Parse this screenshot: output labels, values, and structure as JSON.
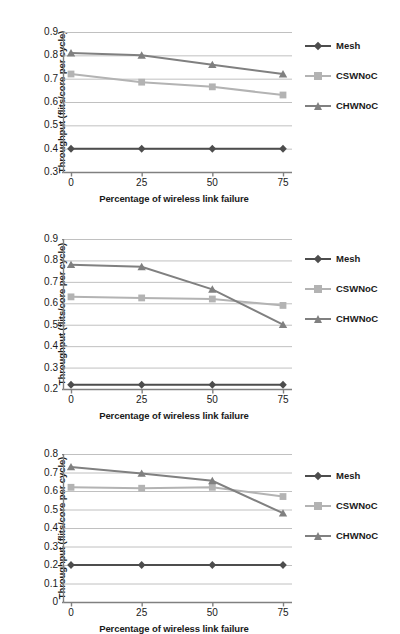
{
  "colors": {
    "mesh": "#4d4d4d",
    "cswnoc": "#b3b3b3",
    "chwnoc": "#808080",
    "axis": "#808080",
    "grid": "#c0c0c0",
    "text": "#1a1a1a"
  },
  "legend": {
    "position": "right",
    "items": [
      {
        "label": "Mesh",
        "marker": "diamond-marker",
        "color_key": "mesh"
      },
      {
        "label": "CSWNoC",
        "marker": "square-marker",
        "color_key": "cswnoc"
      },
      {
        "label": "CHWNoC",
        "marker": "triangle-marker",
        "color_key": "chwnoc"
      }
    ]
  },
  "axis_titles": {
    "y": "Throughput (flits/core per cycle)",
    "x": "Percentage of wireless link failure"
  },
  "chart_data": [
    {
      "type": "line",
      "title": "",
      "xlabel": "Percentage of wireless link failure",
      "ylabel": "Throughput (flits/core per cycle)",
      "categories": [
        0,
        25,
        50,
        75
      ],
      "xticklabels": [
        "0",
        "25",
        "50",
        "75"
      ],
      "yticklabels": [
        "0.3",
        "0.4",
        "0.5",
        "0.6",
        "0.7",
        "0.8",
        "0.9"
      ],
      "xlim": [
        0,
        75
      ],
      "ylim": [
        0.3,
        0.9
      ],
      "ystep": 0.1,
      "grid": true,
      "series": [
        {
          "name": "Mesh",
          "marker": "diamond-marker",
          "values": [
            0.4,
            0.4,
            0.4,
            0.4
          ]
        },
        {
          "name": "CSWNoC",
          "marker": "square-marker",
          "values": [
            0.72,
            0.685,
            0.665,
            0.63
          ]
        },
        {
          "name": "CHWNoC",
          "marker": "triangle-marker",
          "values": [
            0.81,
            0.8,
            0.76,
            0.72
          ]
        }
      ]
    },
    {
      "type": "line",
      "title": "",
      "xlabel": "Percentage of wireless link failure",
      "ylabel": "Throughput (flits/core per cycle)",
      "categories": [
        0,
        25,
        50,
        75
      ],
      "xticklabels": [
        "0",
        "25",
        "50",
        "75"
      ],
      "yticklabels": [
        "0.2",
        "0.3",
        "0.4",
        "0.5",
        "0.6",
        "0.7",
        "0.8",
        "0.9"
      ],
      "xlim": [
        0,
        75
      ],
      "ylim": [
        0.2,
        0.9
      ],
      "ystep": 0.1,
      "grid": true,
      "series": [
        {
          "name": "Mesh",
          "marker": "diamond-marker",
          "values": [
            0.22,
            0.22,
            0.22,
            0.22
          ]
        },
        {
          "name": "CSWNoC",
          "marker": "square-marker",
          "values": [
            0.63,
            0.625,
            0.62,
            0.59
          ]
        },
        {
          "name": "CHWNoC",
          "marker": "triangle-marker",
          "values": [
            0.78,
            0.77,
            0.665,
            0.5
          ]
        }
      ]
    },
    {
      "type": "line",
      "title": "",
      "xlabel": "Percentage of wireless link failure",
      "ylabel": "Throughput (flits/core per cycle)",
      "categories": [
        0,
        25,
        50,
        75
      ],
      "xticklabels": [
        "0",
        "25",
        "50",
        "75"
      ],
      "yticklabels": [
        "0",
        "0.1",
        "0.2",
        "0.3",
        "0.4",
        "0.5",
        "0.6",
        "0.7",
        "0.8"
      ],
      "xlim": [
        0,
        75
      ],
      "ylim": [
        0,
        0.8
      ],
      "ystep": 0.1,
      "grid": true,
      "series": [
        {
          "name": "Mesh",
          "marker": "diamond-marker",
          "values": [
            0.2,
            0.2,
            0.2,
            0.2
          ]
        },
        {
          "name": "CSWNoC",
          "marker": "square-marker",
          "values": [
            0.62,
            0.615,
            0.62,
            0.57
          ]
        },
        {
          "name": "CHWNoC",
          "marker": "triangle-marker",
          "values": [
            0.73,
            0.695,
            0.655,
            0.48
          ]
        }
      ]
    }
  ]
}
